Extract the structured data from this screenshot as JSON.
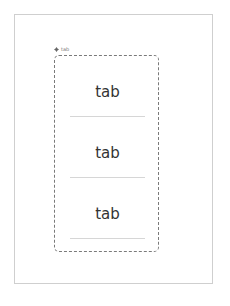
{
  "component": {
    "label": "tab",
    "icon": "component-diamond-icon"
  },
  "tabs": [
    {
      "label": "tab"
    },
    {
      "label": "tab"
    },
    {
      "label": "tab"
    }
  ],
  "colors": {
    "frame_border": "#cfcfcf",
    "dashed_border": "#7a7a7a",
    "tab_text": "#333333",
    "underline": "#d6d6d6"
  }
}
